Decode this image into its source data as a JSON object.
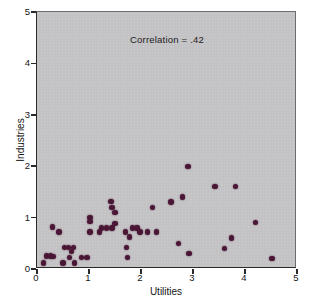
{
  "chart_data": {
    "type": "scatter",
    "title": "",
    "annotation": "Correlation = .42",
    "xlabel": "Utilities",
    "ylabel": "Industries",
    "xlim": [
      0,
      5
    ],
    "ylim": [
      0,
      5
    ],
    "xticks": [
      "0",
      "1",
      "2",
      "3",
      "4",
      "5"
    ],
    "yticks": [
      "0",
      "1",
      "2",
      "3",
      "4",
      "5"
    ],
    "xtick_values": [
      0,
      1,
      2,
      3,
      4,
      5
    ],
    "ytick_values": [
      0,
      1,
      2,
      3,
      4,
      5
    ],
    "grid": false,
    "legend": "none",
    "point_color": "#4a1635",
    "panel_color": "#c3c2c4",
    "points": [
      [
        0.12,
        0.12
      ],
      [
        0.18,
        0.25
      ],
      [
        0.26,
        0.25
      ],
      [
        0.31,
        0.24
      ],
      [
        0.3,
        0.82
      ],
      [
        0.42,
        0.72
      ],
      [
        0.5,
        0.12
      ],
      [
        0.53,
        0.42
      ],
      [
        0.6,
        0.42
      ],
      [
        0.62,
        0.22
      ],
      [
        0.66,
        0.34
      ],
      [
        0.7,
        0.42
      ],
      [
        0.72,
        0.12
      ],
      [
        0.86,
        0.22
      ],
      [
        0.96,
        0.22
      ],
      [
        1.02,
        1.0
      ],
      [
        1.02,
        0.92
      ],
      [
        1.02,
        0.72
      ],
      [
        1.2,
        0.72
      ],
      [
        1.24,
        0.8
      ],
      [
        1.34,
        0.8
      ],
      [
        1.42,
        1.31
      ],
      [
        1.44,
        1.2
      ],
      [
        1.44,
        0.8
      ],
      [
        1.5,
        1.1
      ],
      [
        1.5,
        0.88
      ],
      [
        1.7,
        0.72
      ],
      [
        1.72,
        0.42
      ],
      [
        1.74,
        0.22
      ],
      [
        1.78,
        0.62
      ],
      [
        1.84,
        0.8
      ],
      [
        1.92,
        0.8
      ],
      [
        1.98,
        0.72
      ],
      [
        2.12,
        0.72
      ],
      [
        2.22,
        1.2
      ],
      [
        2.3,
        0.72
      ],
      [
        2.58,
        1.3
      ],
      [
        2.72,
        0.5
      ],
      [
        2.8,
        1.4
      ],
      [
        2.9,
        2.0
      ],
      [
        2.92,
        0.3
      ],
      [
        3.42,
        1.6
      ],
      [
        3.6,
        0.4
      ],
      [
        3.74,
        0.6
      ],
      [
        3.82,
        1.6
      ],
      [
        4.2,
        0.9
      ],
      [
        4.52,
        0.2
      ]
    ]
  }
}
